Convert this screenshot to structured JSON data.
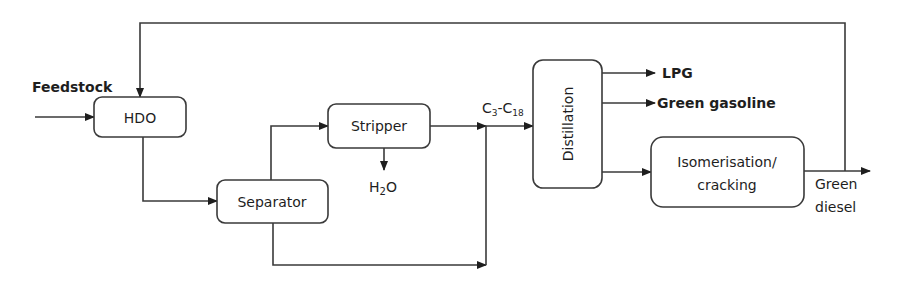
{
  "diagram": {
    "type": "process-flow",
    "colors": {
      "stroke": "#3a3a3a",
      "text": "#1e1e1e",
      "background": "#ffffff"
    },
    "nodes": {
      "hdo": {
        "label": "HDO"
      },
      "separator": {
        "label": "Separator"
      },
      "stripper": {
        "label": "Stripper"
      },
      "distillation": {
        "label": "Distillation"
      },
      "isomerisation": {
        "label_line1": "Isomerisation/",
        "label_line2": "cracking"
      }
    },
    "labels": {
      "feedstock": "Feedstock",
      "h2o_main": "H",
      "h2o_sub": "2",
      "h2o_end": "O",
      "c_range": {
        "c1": "C",
        "s1": "3",
        "dash": "-C",
        "s2": "18"
      },
      "lpg": "LPG",
      "green_gasoline": "Green gasoline",
      "green_diesel_line1": "Green",
      "green_diesel_line2": "diesel"
    },
    "edges": [
      {
        "from": "feedstock",
        "to": "hdo"
      },
      {
        "from": "hdo",
        "to": "separator"
      },
      {
        "from": "separator",
        "to": "stripper"
      },
      {
        "from": "stripper",
        "to": "h2o"
      },
      {
        "from": "stripper",
        "to": "distillation",
        "label": "C3-C18"
      },
      {
        "from": "separator",
        "to": "distillation"
      },
      {
        "from": "distillation",
        "to": "lpg"
      },
      {
        "from": "distillation",
        "to": "green_gasoline"
      },
      {
        "from": "distillation",
        "to": "isomerisation"
      },
      {
        "from": "isomerisation",
        "to": "green_diesel"
      },
      {
        "from": "green_diesel",
        "to": "hdo",
        "note": "recycle"
      }
    ]
  }
}
